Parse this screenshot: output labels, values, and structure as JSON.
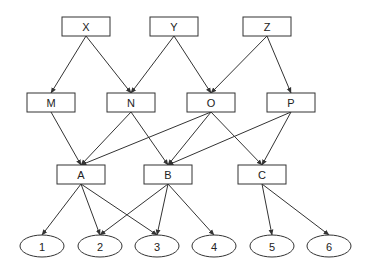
{
  "diagram": {
    "type": "directed-graph",
    "layers": [
      [
        "X",
        "Y",
        "Z"
      ],
      [
        "M",
        "N",
        "O",
        "P"
      ],
      [
        "A",
        "B",
        "C"
      ],
      [
        "1",
        "2",
        "3",
        "4",
        "5",
        "6"
      ]
    ],
    "nodes": [
      {
        "id": "X",
        "label": "X",
        "shape": "rect",
        "x": 62,
        "y": 17,
        "w": 48,
        "h": 19
      },
      {
        "id": "Y",
        "label": "Y",
        "shape": "rect",
        "x": 150,
        "y": 17,
        "w": 48,
        "h": 19
      },
      {
        "id": "Z",
        "label": "Z",
        "shape": "rect",
        "x": 243,
        "y": 17,
        "w": 48,
        "h": 19
      },
      {
        "id": "M",
        "label": "M",
        "shape": "rect",
        "x": 27,
        "y": 93,
        "w": 48,
        "h": 19
      },
      {
        "id": "N",
        "label": "N",
        "shape": "rect",
        "x": 107,
        "y": 93,
        "w": 48,
        "h": 19
      },
      {
        "id": "O",
        "label": "O",
        "shape": "rect",
        "x": 187,
        "y": 93,
        "w": 48,
        "h": 19
      },
      {
        "id": "P",
        "label": "P",
        "shape": "rect",
        "x": 267,
        "y": 93,
        "w": 48,
        "h": 19
      },
      {
        "id": "A",
        "label": "A",
        "shape": "rect",
        "x": 57,
        "y": 165,
        "w": 48,
        "h": 19
      },
      {
        "id": "B",
        "label": "B",
        "shape": "rect",
        "x": 144,
        "y": 165,
        "w": 48,
        "h": 19
      },
      {
        "id": "C",
        "label": "C",
        "shape": "rect",
        "x": 238,
        "y": 165,
        "w": 48,
        "h": 19
      },
      {
        "id": "1",
        "label": "1",
        "shape": "ellipse",
        "cx": 42,
        "cy": 246,
        "rx": 22,
        "ry": 11
      },
      {
        "id": "2",
        "label": "2",
        "shape": "ellipse",
        "cx": 100,
        "cy": 246,
        "rx": 22,
        "ry": 11
      },
      {
        "id": "3",
        "label": "3",
        "shape": "ellipse",
        "cx": 157,
        "cy": 246,
        "rx": 22,
        "ry": 11
      },
      {
        "id": "4",
        "label": "4",
        "shape": "ellipse",
        "cx": 214,
        "cy": 246,
        "rx": 22,
        "ry": 11
      },
      {
        "id": "5",
        "label": "5",
        "shape": "ellipse",
        "cx": 272,
        "cy": 246,
        "rx": 22,
        "ry": 11
      },
      {
        "id": "6",
        "label": "6",
        "shape": "ellipse",
        "cx": 329,
        "cy": 246,
        "rx": 22,
        "ry": 11
      }
    ],
    "edges": [
      [
        "X",
        "M"
      ],
      [
        "X",
        "N"
      ],
      [
        "Y",
        "N"
      ],
      [
        "Y",
        "O"
      ],
      [
        "Z",
        "O"
      ],
      [
        "Z",
        "P"
      ],
      [
        "M",
        "A"
      ],
      [
        "N",
        "A"
      ],
      [
        "N",
        "B"
      ],
      [
        "O",
        "A"
      ],
      [
        "O",
        "B"
      ],
      [
        "O",
        "C"
      ],
      [
        "P",
        "B"
      ],
      [
        "P",
        "C"
      ],
      [
        "A",
        "1"
      ],
      [
        "A",
        "2"
      ],
      [
        "A",
        "3"
      ],
      [
        "B",
        "2"
      ],
      [
        "B",
        "3"
      ],
      [
        "B",
        "4"
      ],
      [
        "C",
        "5"
      ],
      [
        "C",
        "6"
      ]
    ],
    "colors": {
      "stroke": "#333333",
      "fill": "#ffffff",
      "text": "#222222"
    }
  }
}
